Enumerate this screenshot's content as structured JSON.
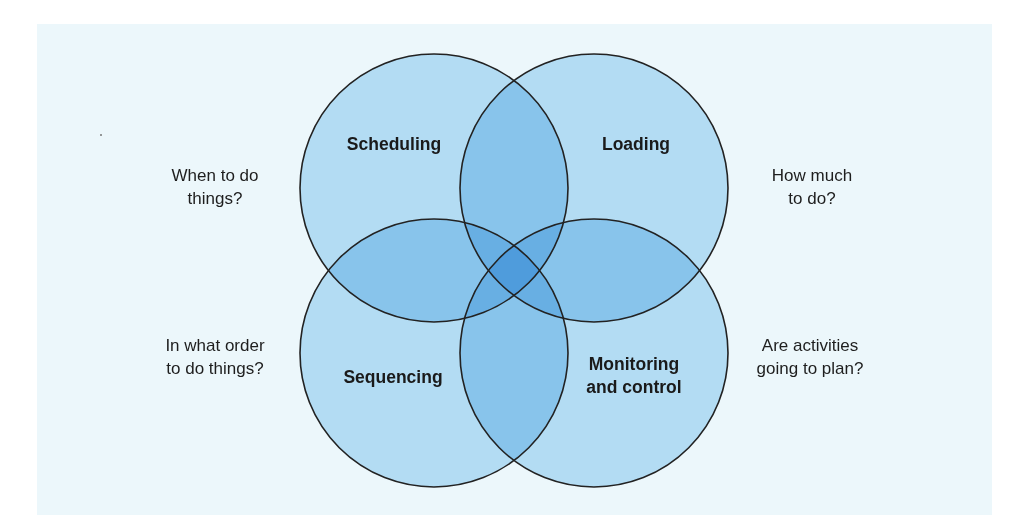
{
  "diagram": {
    "type": "venn",
    "colors": {
      "background_panel": "#ecf7fb",
      "circle_fill": "#c2e4f7",
      "circle_stroke": "#222222"
    },
    "circles": [
      {
        "id": "scheduling",
        "label": "Scheduling",
        "cx": 434,
        "cy": 188,
        "r": 134
      },
      {
        "id": "loading",
        "label": "Loading",
        "cx": 594,
        "cy": 188,
        "r": 134
      },
      {
        "id": "sequencing",
        "label": "Sequencing",
        "cx": 434,
        "cy": 353,
        "r": 134
      },
      {
        "id": "monitoring",
        "label_line1": "Monitoring",
        "label_line2": "and control",
        "cx": 594,
        "cy": 353,
        "r": 134
      }
    ],
    "questions": {
      "scheduling": {
        "line1": "When to do",
        "line2": "things?"
      },
      "loading": {
        "line1": "How much",
        "line2": "to do?"
      },
      "sequencing": {
        "line1": "In what order",
        "line2": "to do things?"
      },
      "monitoring": {
        "line1": "Are activities",
        "line2": "going to plan?"
      }
    }
  }
}
